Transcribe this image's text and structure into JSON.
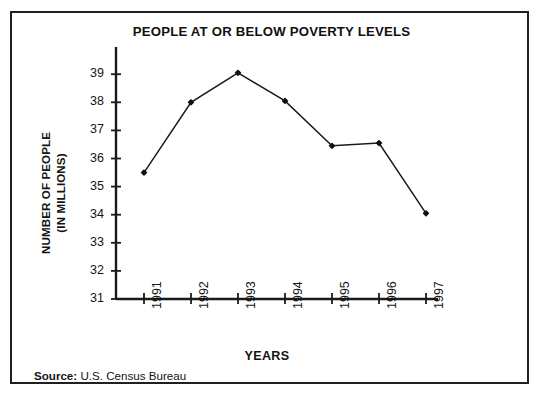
{
  "figure": {
    "title": "PEOPLE AT OR BELOW POVERTY LEVELS",
    "source_key": "Source:",
    "source_value": "U.S. Census Bureau",
    "border_color": "#1f1f24",
    "ink_color": "#111111",
    "background": "#ffffff"
  },
  "chart_data": {
    "type": "line",
    "title": "PEOPLE AT OR BELOW POVERTY LEVELS",
    "xlabel": "YEARS",
    "ylabel": "NUMBER OF PEOPLE (IN MILLIONS)",
    "ylabel_line1": "NUMBER OF PEOPLE",
    "ylabel_line2": "(IN MILLIONS)",
    "categories": [
      "1991",
      "1992",
      "1993",
      "1994",
      "1995",
      "1996",
      "1997"
    ],
    "x": [
      1991,
      1992,
      1993,
      1994,
      1995,
      1996,
      1997
    ],
    "values": [
      35.5,
      38.0,
      39.05,
      38.05,
      36.45,
      36.55,
      34.05
    ],
    "series": [
      {
        "name": "People at or below poverty levels",
        "values": [
          35.5,
          38.0,
          39.05,
          38.05,
          36.45,
          36.55,
          34.05
        ]
      }
    ],
    "ylim": [
      31,
      39.6
    ],
    "yticks": [
      31,
      32,
      33,
      34,
      35,
      36,
      37,
      38,
      39
    ],
    "ytick_labels": [
      "31",
      "32",
      "33",
      "34",
      "35",
      "36",
      "37",
      "38",
      "39"
    ],
    "xtick_labels": [
      "1991",
      "1992",
      "1993",
      "1994",
      "1995",
      "1996",
      "1997"
    ],
    "grid": false,
    "legend": false,
    "legend_position": "none",
    "line_color": "#1a1a1a",
    "marker": "diamond",
    "marker_color": "#111111",
    "annotations": []
  }
}
